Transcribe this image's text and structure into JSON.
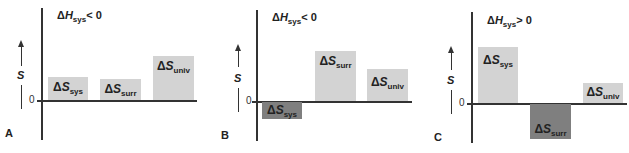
{
  "axis": {
    "y_label": "S",
    "zero_label": "0"
  },
  "panels": [
    {
      "letter": "A",
      "condition": {
        "delta": "Δ",
        "sym": "H",
        "sub": "sys",
        "rel": "< 0"
      },
      "bars": [
        {
          "delta": "Δ",
          "sym": "S",
          "sub": "sys",
          "sign": "positive",
          "shade": "light"
        },
        {
          "delta": "Δ",
          "sym": "S",
          "sub": "surr",
          "sign": "positive",
          "shade": "light"
        },
        {
          "delta": "Δ",
          "sym": "S",
          "sub": "univ",
          "sign": "positive",
          "shade": "light"
        }
      ]
    },
    {
      "letter": "B",
      "condition": {
        "delta": "Δ",
        "sym": "H",
        "sub": "sys",
        "rel": "< 0"
      },
      "bars": [
        {
          "delta": "Δ",
          "sym": "S",
          "sub": "sys",
          "sign": "negative",
          "shade": "dark"
        },
        {
          "delta": "Δ",
          "sym": "S",
          "sub": "surr",
          "sign": "positive",
          "shade": "light"
        },
        {
          "delta": "Δ",
          "sym": "S",
          "sub": "univ",
          "sign": "positive",
          "shade": "light"
        }
      ]
    },
    {
      "letter": "C",
      "condition": {
        "delta": "Δ",
        "sym": "H",
        "sub": "sys",
        "rel": "> 0"
      },
      "bars": [
        {
          "delta": "Δ",
          "sym": "S",
          "sub": "sys",
          "sign": "positive",
          "shade": "light"
        },
        {
          "delta": "Δ",
          "sym": "S",
          "sub": "surr",
          "sign": "negative",
          "shade": "dark"
        },
        {
          "delta": "Δ",
          "sym": "S",
          "sub": "univ",
          "sign": "positive",
          "shade": "light"
        }
      ]
    }
  ],
  "colors": {
    "positive_bar": "#d3d3d3",
    "negative_bar": "#7f7f7f",
    "axis": "#333333"
  }
}
